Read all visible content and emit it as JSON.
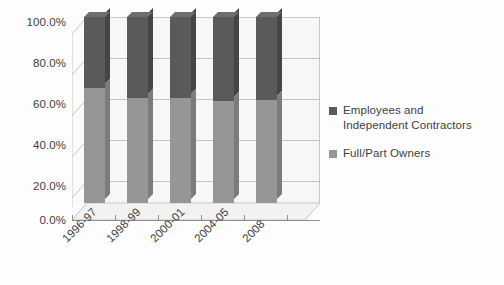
{
  "chart_data": {
    "type": "bar",
    "subtype": "stacked-100-percent-3d",
    "title": "",
    "xlabel": "",
    "ylabel": "",
    "categories": [
      "1996-97",
      "1998-99",
      "2000-01",
      "2004-05",
      "2008"
    ],
    "series": [
      {
        "name": "Employees and Independent Contractors",
        "color": "#5a5a5a",
        "values": [
          38.0,
          43.5,
          43.5,
          45.0,
          44.5
        ]
      },
      {
        "name": "Full/Part Owners",
        "color": "#969696",
        "values": [
          62.0,
          56.5,
          56.5,
          55.0,
          55.5
        ]
      }
    ],
    "ylim": [
      0,
      100
    ],
    "yticks": [
      0,
      20,
      40,
      60,
      80,
      100
    ],
    "ytick_labels": [
      "0.0%",
      "20.0%",
      "40.0%",
      "60.0%",
      "80.0%",
      "100.0%"
    ],
    "grid": true,
    "legend_position": "right"
  },
  "legend": {
    "entries": [
      {
        "label_line1": "Employees and",
        "label_line2": "Independent Contractors",
        "color": "#5a5a5a"
      },
      {
        "label_line1": "Full/Part Owners",
        "label_line2": "",
        "color": "#969696"
      }
    ]
  }
}
